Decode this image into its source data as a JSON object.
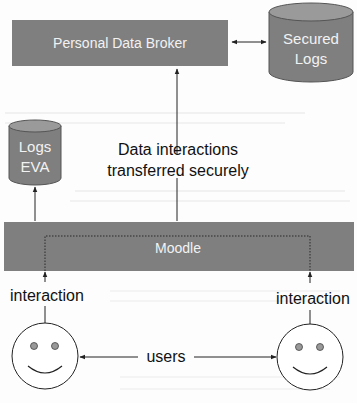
{
  "diagram": {
    "nodes": {
      "broker": {
        "label": "Personal Data Broker"
      },
      "secured_logs": {
        "line1": "Secured",
        "line2": "Logs"
      },
      "logs_eva": {
        "line1": "Logs",
        "line2": "EVA"
      },
      "moodle": {
        "label": "Moodle"
      }
    },
    "edges": {
      "transfer": {
        "line1": "Data interactions",
        "line2": "transferred securely"
      },
      "left_interaction": {
        "label": "interaction"
      },
      "right_interaction": {
        "label": "interaction"
      },
      "users": {
        "label": "users"
      }
    },
    "actors": [
      {
        "name": "user-left",
        "icon": "smiley-face-icon"
      },
      {
        "name": "user-right",
        "icon": "smiley-face-icon"
      }
    ],
    "colors": {
      "box_fill": "#7f7f7f",
      "cylinder_top": "#9a9a9a",
      "stroke": "#333333",
      "text_on_dark": "#f2f2f2",
      "text": "#111111"
    }
  }
}
